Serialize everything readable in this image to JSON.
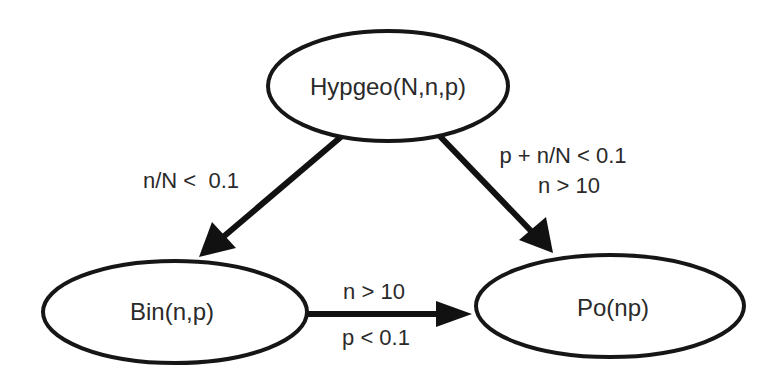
{
  "diagram": {
    "type": "directed-graph",
    "colors": {
      "stroke": "#161616",
      "text": "#2a2a2a",
      "background": "#ffffff"
    },
    "nodes": [
      {
        "id": "hypgeo",
        "label": "Hypgeo(N,n,p)"
      },
      {
        "id": "bin",
        "label": "Bin(n,p)"
      },
      {
        "id": "po",
        "label": "Po(np)"
      }
    ],
    "edges": [
      {
        "from": "hypgeo",
        "to": "bin",
        "conditions": [
          "n/N <  0.1"
        ]
      },
      {
        "from": "hypgeo",
        "to": "po",
        "conditions": [
          "p + n/N < 0.1",
          "n > 10"
        ]
      },
      {
        "from": "bin",
        "to": "po",
        "conditions": [
          "n > 10",
          "p < 0.1"
        ]
      }
    ]
  }
}
